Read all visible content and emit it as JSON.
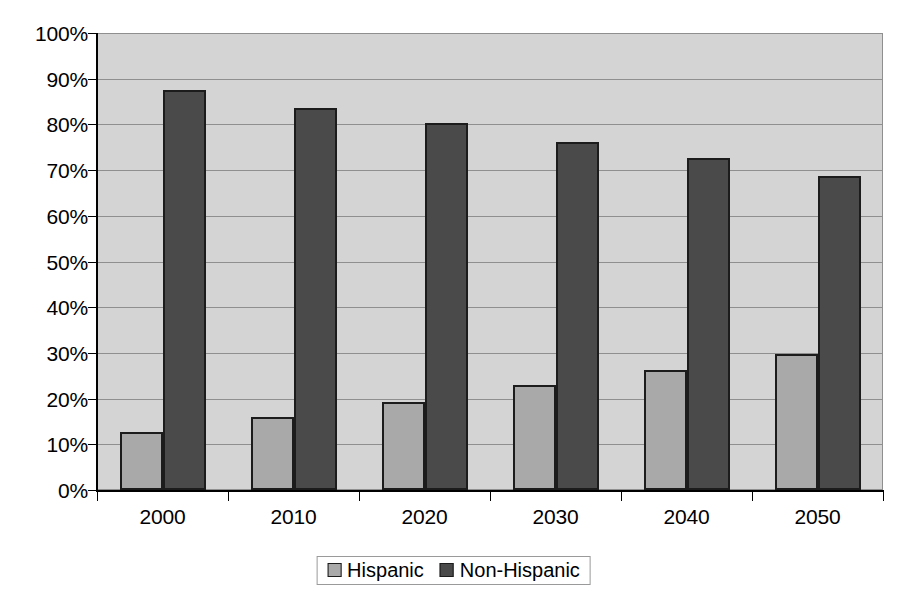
{
  "chart_data": {
    "type": "bar",
    "title": "",
    "subtitle": "",
    "xlabel": "",
    "ylabel": "",
    "categories": [
      "2000",
      "2010",
      "2020",
      "2030",
      "2040",
      "2050"
    ],
    "series": [
      {
        "name": "Hispanic",
        "color": "#a9a9a9",
        "values": [
          12.7,
          16.0,
          19.3,
          23.0,
          26.3,
          29.8
        ]
      },
      {
        "name": "Non-Hispanic",
        "color": "#4a4a4a",
        "values": [
          87.5,
          83.6,
          80.3,
          76.2,
          72.6,
          68.7
        ]
      }
    ],
    "ylim": [
      0,
      100
    ],
    "ytick_labels": [
      "0%",
      "10%",
      "20%",
      "30%",
      "40%",
      "50%",
      "60%",
      "70%",
      "80%",
      "90%",
      "100%"
    ],
    "ytick_values": [
      0,
      10,
      20,
      30,
      40,
      50,
      60,
      70,
      80,
      90,
      100
    ],
    "grid": true,
    "grid_axis": "y",
    "legend_position": "bottom",
    "plot_background": "#d4d4d4",
    "value_labels_shown": false
  }
}
